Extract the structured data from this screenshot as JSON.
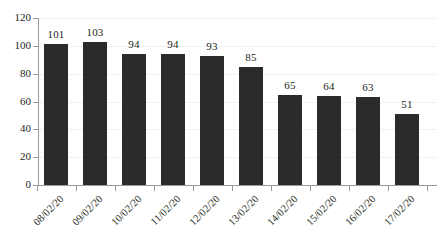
{
  "chart_data": {
    "type": "bar",
    "title": "",
    "subtitle": "",
    "xlabel": "",
    "ylabel": "",
    "categories": [
      "08/02/20",
      "09/02/20",
      "10/02/20",
      "11/02/20",
      "12/02/20",
      "13/02/20",
      "14/02/20",
      "15/02/20",
      "16/02/20",
      "17/02/20"
    ],
    "values": [
      101,
      103,
      94,
      94,
      93,
      85,
      65,
      64,
      63,
      51
    ],
    "data_labels": [
      "101",
      "103",
      "94",
      "94",
      "93",
      "85",
      "65",
      "64",
      "63",
      "51"
    ],
    "ylim": [
      0,
      120
    ],
    "y_ticks": [
      0,
      20,
      40,
      60,
      80,
      100,
      120
    ],
    "y_tick_labels": [
      "0",
      "20",
      "40",
      "60",
      "80",
      "100",
      "120"
    ],
    "grid": true,
    "legend": false,
    "legend_position": "none",
    "bar_color": "#2b2b2b",
    "axis_color": "#9a9a9a",
    "gridline_color": "#f0f0f0",
    "text_color": "#231f20",
    "x_label_rotation": -45
  }
}
